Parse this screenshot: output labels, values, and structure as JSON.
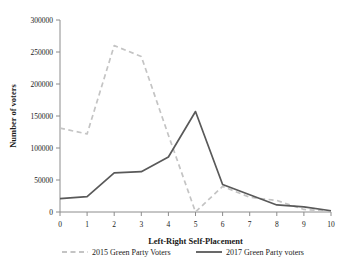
{
  "chart_data": {
    "type": "line",
    "title": "",
    "xlabel": "Left-Right Self-Placement",
    "ylabel": "Number of voters",
    "x": [
      0,
      1,
      2,
      3,
      4,
      5,
      6,
      7,
      8,
      9,
      10
    ],
    "xtick_labels": [
      "0",
      "1",
      "2",
      "3",
      "4",
      "5",
      "6",
      "7",
      "8",
      "9",
      "10"
    ],
    "ytick_labels": [
      "0",
      "50000",
      "100000",
      "150000",
      "200000",
      "250000",
      "300000"
    ],
    "yticks": [
      0,
      50000,
      100000,
      150000,
      200000,
      250000,
      300000
    ],
    "xlim": [
      0,
      10
    ],
    "ylim": [
      0,
      300000
    ],
    "grid": false,
    "legend_position": "bottom",
    "series": [
      {
        "name": "2015 Green Party Voters",
        "style": "dashed",
        "color": "#c4c4c4",
        "values": [
          131000,
          122000,
          260000,
          243000,
          120000,
          0,
          40000,
          23000,
          18000,
          4000,
          1000
        ]
      },
      {
        "name": "2017 Green Party voters",
        "style": "solid",
        "color": "#595959",
        "values": [
          21000,
          24000,
          61000,
          63000,
          86000,
          157000,
          43000,
          27000,
          11000,
          8000,
          2000
        ]
      }
    ]
  },
  "legend": {
    "items": [
      {
        "label": "2015 Green Party Voters",
        "style": "dashed",
        "color": "#c4c4c4"
      },
      {
        "label": "2017 Green Party voters",
        "style": "solid",
        "color": "#595959"
      }
    ]
  }
}
